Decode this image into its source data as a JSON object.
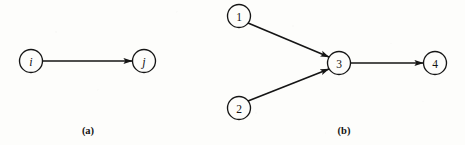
{
  "figure": {
    "background_color": "#fdfdfb",
    "ink_color": "#151515",
    "panels": [
      {
        "id": "panel-a",
        "caption": "(a)",
        "caption_x": 88,
        "caption_y": 130,
        "nodes": [
          {
            "id": "i",
            "label": "i",
            "style": "italic",
            "cx": 31,
            "cy": 61,
            "r": 11.5
          },
          {
            "id": "j",
            "label": "j",
            "style": "italic",
            "cx": 144,
            "cy": 61,
            "r": 11.5
          }
        ],
        "edges": [
          {
            "id": "edge-i-j",
            "from": "i",
            "to": "j",
            "x1": 43,
            "y1": 61,
            "x2": 132,
            "y2": 61,
            "directed": true
          }
        ]
      },
      {
        "id": "panel-b",
        "caption": "(b)",
        "caption_x": 344,
        "caption_y": 130,
        "nodes": [
          {
            "id": "1",
            "label": "1",
            "style": "upright",
            "cx": 239,
            "cy": 16,
            "r": 11.5
          },
          {
            "id": "2",
            "label": "2",
            "style": "upright",
            "cx": 239,
            "cy": 108,
            "r": 11.5
          },
          {
            "id": "3",
            "label": "3",
            "style": "upright",
            "cx": 339,
            "cy": 63,
            "r": 11.5
          },
          {
            "id": "4",
            "label": "4",
            "style": "upright",
            "cx": 435,
            "cy": 63,
            "r": 11.5
          }
        ],
        "edges": [
          {
            "id": "edge-1-3",
            "from": "1",
            "to": "3",
            "x1": 248,
            "y1": 23,
            "x2": 329,
            "y2": 57,
            "directed": true
          },
          {
            "id": "edge-2-3",
            "from": "2",
            "to": "3",
            "x1": 248,
            "y1": 101,
            "x2": 329,
            "y2": 69,
            "directed": true
          },
          {
            "id": "edge-3-4",
            "from": "3",
            "to": "4",
            "x1": 351,
            "y1": 63,
            "x2": 423,
            "y2": 63,
            "directed": true
          }
        ]
      }
    ]
  },
  "chart_data": {
    "type": "diagram",
    "diagram_kind": "directed-graph",
    "title": "",
    "panels": [
      {
        "caption": "(a)",
        "nodes": [
          "i",
          "j"
        ],
        "edges": [
          [
            "i",
            "j"
          ]
        ]
      },
      {
        "caption": "(b)",
        "nodes": [
          "1",
          "2",
          "3",
          "4"
        ],
        "edges": [
          [
            "1",
            "3"
          ],
          [
            "2",
            "3"
          ],
          [
            "3",
            "4"
          ]
        ]
      }
    ]
  }
}
